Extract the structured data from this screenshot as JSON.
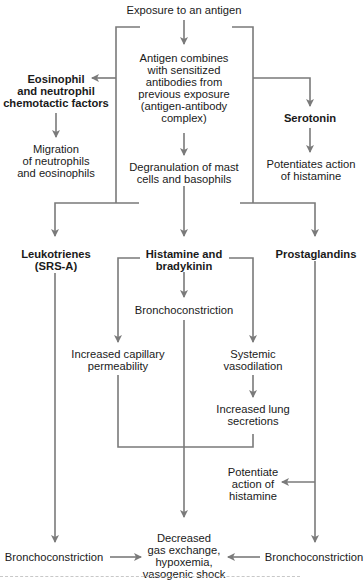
{
  "diagram": {
    "type": "flowchart",
    "line_color": "#7a7a7a",
    "nodes": {
      "exposure": "Exposure to an antigen",
      "antigen_combines": [
        "Antigen combines",
        "with sensitized",
        "antibodies from",
        "previous exposure",
        "(antigen-antibody",
        "complex)"
      ],
      "eosinophil": [
        "Eosinophil",
        "and neutrophil",
        "chemotactic factors"
      ],
      "migration": [
        "Migration",
        "of neutrophils",
        "and eosinophils"
      ],
      "serotonin": "Serotonin",
      "potentiates": [
        "Potentiates action",
        "of histamine"
      ],
      "degranulation": [
        "Degranulation of mast",
        "cells and basophils"
      ],
      "leukotrienes": [
        "Leukotrienes",
        "(SRS-A)"
      ],
      "histamine": [
        "Histamine and",
        "bradykinin"
      ],
      "prostaglandins": "Prostaglandins",
      "broncho_center": "Bronchoconstriction",
      "capillary": [
        "Increased capillary",
        "permeability"
      ],
      "vasodilation": [
        "Systemic",
        "vasodilation"
      ],
      "lung_secretions": [
        "Increased lung",
        "secretions"
      ],
      "potentiate2": [
        "Potentiate",
        "action of",
        "histamine"
      ],
      "decreased": [
        "Decreased",
        "gas exchange,",
        "hypoxemia,",
        "vasogenic shock"
      ],
      "broncho_left": "Bronchoconstriction",
      "broncho_right": "Bronchoconstriction"
    }
  }
}
